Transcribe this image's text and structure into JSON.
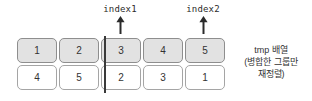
{
  "diagram": {
    "pointers": [
      {
        "label": "index1",
        "target_column": 3,
        "left": 80,
        "arrow": "up-arrow"
      },
      {
        "label": "index2",
        "target_column": 5,
        "left": 163,
        "arrow": "up-arrow"
      }
    ],
    "rows": [
      {
        "name": "top-row",
        "fill": "#e2e2e2",
        "values": [
          "1",
          "2",
          "3",
          "4",
          "5"
        ]
      },
      {
        "name": "bottom-row",
        "fill": "#ffffff",
        "values": [
          "4",
          "5",
          "2",
          "3",
          "1"
        ]
      }
    ],
    "divider": {
      "left": 104
    },
    "caption": {
      "line1": "tmp 배열",
      "line2": "(병합한 그룹만",
      "line3": "재정렬)"
    },
    "colors": {
      "top_cell_fill": "#e2e2e2",
      "bottom_cell_fill": "#ffffff",
      "cell_border": "#9a9a9a",
      "divider": "#3a3a3a",
      "text": "#333333",
      "background": "#ffffff"
    }
  }
}
